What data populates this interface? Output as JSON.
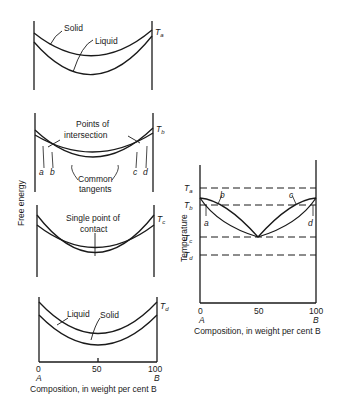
{
  "left_figure": {
    "y_axis_label": "Free energy",
    "x_axis_label": "Composition, in weight per cent B",
    "x_ticks": [
      "0",
      "50",
      "100"
    ],
    "x_end_labels": [
      "A",
      "B"
    ],
    "panels": [
      {
        "temperature": "T",
        "temperature_sub": "a",
        "labels": {
          "solid": "Solid",
          "liquid": "Liquid"
        }
      },
      {
        "temperature": "T",
        "temperature_sub": "b",
        "labels": {
          "intersection": "Points of",
          "intersection2": "intersection",
          "tangents": "Common",
          "tangents2": "tangents",
          "a": "a",
          "b": "b",
          "c": "c",
          "d": "d"
        }
      },
      {
        "temperature": "T",
        "temperature_sub": "c",
        "labels": {
          "contact": "Single point of",
          "contact2": "contact"
        }
      },
      {
        "temperature": "T",
        "temperature_sub": "d",
        "labels": {
          "liquid": "Liquid",
          "solid": "Solid"
        }
      }
    ]
  },
  "right_figure": {
    "y_axis_label": "Temperature",
    "x_axis_label": "Composition, in weight per cent B",
    "x_ticks": [
      "0",
      "50",
      "100"
    ],
    "x_end_labels": [
      "A",
      "B"
    ],
    "temperatures": [
      {
        "t": "T",
        "sub": "a"
      },
      {
        "t": "T",
        "sub": "b"
      },
      {
        "t": "T",
        "sub": "c"
      },
      {
        "t": "T",
        "sub": "d"
      }
    ],
    "point_labels": {
      "a": "a",
      "b": "b",
      "c": "c",
      "d": "d"
    }
  }
}
